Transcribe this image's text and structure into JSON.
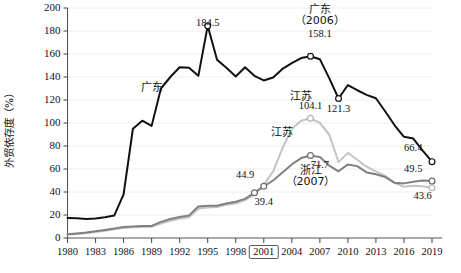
{
  "chart_data": {
    "type": "line",
    "title": "",
    "xlabel": "",
    "ylabel": "外贸依存度（%）",
    "ylim": [
      0,
      200
    ],
    "xlim": [
      1980,
      2019
    ],
    "yticks": [
      0,
      20,
      40,
      60,
      80,
      100,
      120,
      140,
      160,
      180,
      200
    ],
    "xticks": [
      1980,
      1983,
      1986,
      1989,
      1992,
      1995,
      1998,
      2001,
      2004,
      2007,
      2010,
      2013,
      2016,
      2019
    ],
    "xtick_highlight": "2001",
    "grid": "horizontal",
    "legend": "inline-labels",
    "x": [
      1980,
      1981,
      1982,
      1983,
      1984,
      1985,
      1986,
      1987,
      1988,
      1989,
      1990,
      1991,
      1992,
      1993,
      1994,
      1995,
      1996,
      1997,
      1998,
      1999,
      2000,
      2001,
      2002,
      2003,
      2004,
      2005,
      2006,
      2007,
      2008,
      2009,
      2010,
      2011,
      2012,
      2013,
      2014,
      2015,
      2016,
      2017,
      2018,
      2019
    ],
    "series": [
      {
        "name": "广东",
        "color": "#111111",
        "values": [
          17.5,
          17.2,
          16.5,
          17.0,
          18.0,
          19.5,
          38.0,
          95.0,
          102.0,
          97.5,
          130.0,
          140.0,
          148.5,
          148.0,
          141.0,
          184.5,
          155.0,
          148.0,
          140.5,
          148.5,
          141.0,
          137.0,
          139.5,
          147.0,
          152.0,
          156.5,
          158.1,
          155.5,
          139.0,
          121.3,
          133.0,
          128.5,
          124.5,
          121.5,
          110.0,
          98.0,
          88.0,
          86.5,
          76.0,
          66.4
        ]
      },
      {
        "name": "浙江",
        "color": "#808080",
        "values": [
          3.2,
          4.0,
          4.8,
          5.8,
          7.0,
          8.2,
          9.6,
          10.1,
          10.4,
          10.5,
          14.0,
          16.5,
          18.2,
          19.5,
          27.5,
          28.0,
          28.0,
          30.0,
          31.5,
          34.0,
          39.4,
          44.9,
          50.0,
          57.0,
          64.0,
          69.5,
          71.7,
          70.5,
          63.0,
          58.0,
          64.0,
          62.5,
          57.0,
          55.5,
          53.0,
          48.0,
          47.5,
          49.0,
          50.0,
          49.5
        ]
      },
      {
        "name": "江苏",
        "color": "#c4c4c4",
        "values": [
          2.8,
          3.4,
          4.2,
          5.2,
          6.3,
          7.5,
          8.8,
          9.3,
          9.6,
          9.7,
          12.5,
          15.0,
          16.8,
          18.0,
          25.5,
          26.5,
          27.0,
          29.0,
          30.0,
          33.0,
          38.0,
          46.0,
          58.0,
          78.0,
          95.0,
          102.0,
          104.1,
          100.0,
          90.0,
          66.0,
          74.0,
          68.0,
          62.0,
          58.0,
          54.0,
          48.0,
          44.5,
          45.5,
          45.0,
          43.6
        ]
      }
    ],
    "annotations": [
      {
        "text": "184.5",
        "x": 1995,
        "y": 184.5,
        "kind": "value",
        "series": "广东"
      },
      {
        "text": "广东",
        "x": 1989,
        "y": 128,
        "kind": "series-label",
        "series": "广东"
      },
      {
        "text": "广东",
        "x": 2007,
        "y": 196,
        "kind": "series-label",
        "series": "广东"
      },
      {
        "text": "（2006）",
        "x": 2007,
        "y": 186,
        "kind": "series-note",
        "series": "广东"
      },
      {
        "text": "158.1",
        "x": 2007,
        "y": 175,
        "kind": "value",
        "series": "广东"
      },
      {
        "text": "121.3",
        "x": 2009,
        "y": 110,
        "kind": "value",
        "series": "广东"
      },
      {
        "text": "66.4",
        "x": 2017,
        "y": 76,
        "kind": "value",
        "series": "广东"
      },
      {
        "text": "江苏",
        "x": 2005,
        "y": 120,
        "kind": "series-label",
        "series": "江苏"
      },
      {
        "text": "104.1",
        "x": 2006,
        "y": 112,
        "kind": "value",
        "series": "江苏"
      },
      {
        "text": "江苏",
        "x": 2003,
        "y": 89,
        "kind": "series-label",
        "series": "江苏"
      },
      {
        "text": "43.6",
        "x": 2018,
        "y": 34,
        "kind": "value",
        "series": "江苏"
      },
      {
        "text": "浙江",
        "x": 2006,
        "y": 56,
        "kind": "series-label",
        "series": "浙江"
      },
      {
        "text": "（2007）",
        "x": 2006,
        "y": 46,
        "kind": "series-note",
        "series": "浙江"
      },
      {
        "text": "71.7",
        "x": 2007,
        "y": 61,
        "kind": "value",
        "series": "浙江"
      },
      {
        "text": "44.9",
        "x": 1999,
        "y": 52,
        "kind": "value",
        "series": "浙江"
      },
      {
        "text": "39.4",
        "x": 2001,
        "y": 29,
        "kind": "value",
        "series": "浙江"
      },
      {
        "text": "49.5",
        "x": 2017,
        "y": 57,
        "kind": "value",
        "series": "浙江"
      }
    ],
    "markers": [
      {
        "series": "广东",
        "x": 1995,
        "y": 184.5
      },
      {
        "series": "广东",
        "x": 2006,
        "y": 158.1
      },
      {
        "series": "广东",
        "x": 2009,
        "y": 121.3
      },
      {
        "series": "广东",
        "x": 2019,
        "y": 66.4
      },
      {
        "series": "江苏",
        "x": 2006,
        "y": 104.1
      },
      {
        "series": "江苏",
        "x": 2019,
        "y": 43.6
      },
      {
        "series": "浙江",
        "x": 2000,
        "y": 39.4
      },
      {
        "series": "浙江",
        "x": 2001,
        "y": 44.9
      },
      {
        "series": "浙江",
        "x": 2006,
        "y": 71.7
      },
      {
        "series": "浙江",
        "x": 2019,
        "y": 49.5
      }
    ]
  }
}
